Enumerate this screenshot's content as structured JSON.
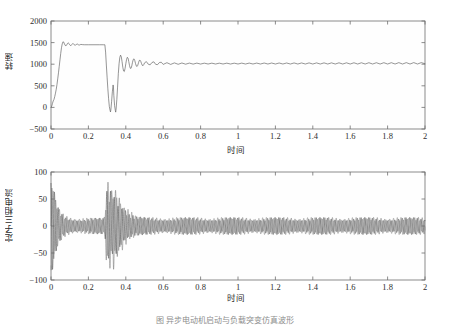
{
  "figure": {
    "caption": "图 异步电动机启动与负载突变仿真波形"
  },
  "chart_data": [
    {
      "id": "speed",
      "type": "line",
      "title": "",
      "xlabel": "时间",
      "ylabel": "转速",
      "xlim": [
        0,
        2
      ],
      "ylim": [
        -500,
        2000
      ],
      "xticks": [
        0,
        0.2,
        0.4,
        0.6,
        0.8,
        1,
        1.2,
        1.4,
        1.6,
        1.8,
        2
      ],
      "xticklabels": [
        "0",
        "0.2",
        "0.4",
        "0.6",
        "0.8",
        "1",
        "1.2",
        "1.4",
        "1.6",
        "1.8",
        "2"
      ],
      "yticks": [
        -500,
        0,
        500,
        1000,
        1500,
        2000
      ],
      "yticklabels": [
        "-500",
        "0",
        "500",
        "1000",
        "1500",
        "2000"
      ],
      "grid": false,
      "legend": null,
      "series": [
        {
          "name": "转速",
          "color": "#5d5d5d",
          "points": [
            [
              0.0,
              0
            ],
            [
              0.004,
              30
            ],
            [
              0.008,
              95
            ],
            [
              0.012,
              150
            ],
            [
              0.016,
              185
            ],
            [
              0.02,
              250
            ],
            [
              0.024,
              330
            ],
            [
              0.028,
              420
            ],
            [
              0.032,
              530
            ],
            [
              0.036,
              660
            ],
            [
              0.04,
              800
            ],
            [
              0.044,
              950
            ],
            [
              0.048,
              1100
            ],
            [
              0.052,
              1250
            ],
            [
              0.056,
              1380
            ],
            [
              0.06,
              1470
            ],
            [
              0.064,
              1520
            ],
            [
              0.068,
              1510
            ],
            [
              0.072,
              1470
            ],
            [
              0.076,
              1435
            ],
            [
              0.08,
              1425
            ],
            [
              0.084,
              1445
            ],
            [
              0.088,
              1480
            ],
            [
              0.092,
              1495
            ],
            [
              0.096,
              1480
            ],
            [
              0.1,
              1450
            ],
            [
              0.104,
              1432
            ],
            [
              0.108,
              1435
            ],
            [
              0.112,
              1458
            ],
            [
              0.116,
              1478
            ],
            [
              0.12,
              1472
            ],
            [
              0.124,
              1452
            ],
            [
              0.128,
              1438
            ],
            [
              0.132,
              1442
            ],
            [
              0.136,
              1460
            ],
            [
              0.14,
              1468
            ],
            [
              0.144,
              1458
            ],
            [
              0.148,
              1446
            ],
            [
              0.152,
              1444
            ],
            [
              0.156,
              1452
            ],
            [
              0.16,
              1458
            ],
            [
              0.17,
              1452
            ],
            [
              0.18,
              1450
            ],
            [
              0.2,
              1450
            ],
            [
              0.23,
              1450
            ],
            [
              0.26,
              1450
            ],
            [
              0.28,
              1450
            ],
            [
              0.288,
              1450
            ],
            [
              0.292,
              1280
            ],
            [
              0.296,
              980
            ],
            [
              0.3,
              700
            ],
            [
              0.304,
              430
            ],
            [
              0.308,
              200
            ],
            [
              0.312,
              20
            ],
            [
              0.316,
              -70
            ],
            [
              0.318,
              -105
            ],
            [
              0.32,
              -60
            ],
            [
              0.324,
              130
            ],
            [
              0.328,
              360
            ],
            [
              0.332,
              520
            ],
            [
              0.334,
              470
            ],
            [
              0.336,
              280
            ],
            [
              0.34,
              40
            ],
            [
              0.344,
              -70
            ],
            [
              0.346,
              -110
            ],
            [
              0.348,
              -40
            ],
            [
              0.352,
              180
            ],
            [
              0.356,
              470
            ],
            [
              0.36,
              780
            ],
            [
              0.364,
              1010
            ],
            [
              0.368,
              1160
            ],
            [
              0.372,
              1210
            ],
            [
              0.376,
              1170
            ],
            [
              0.38,
              1060
            ],
            [
              0.384,
              930
            ],
            [
              0.388,
              845
            ],
            [
              0.392,
              830
            ],
            [
              0.396,
              900
            ],
            [
              0.4,
              1010
            ],
            [
              0.404,
              1110
            ],
            [
              0.408,
              1160
            ],
            [
              0.412,
              1140
            ],
            [
              0.416,
              1060
            ],
            [
              0.42,
              965
            ],
            [
              0.424,
              905
            ],
            [
              0.428,
              905
            ],
            [
              0.432,
              960
            ],
            [
              0.436,
              1045
            ],
            [
              0.44,
              1110
            ],
            [
              0.444,
              1125
            ],
            [
              0.448,
              1085
            ],
            [
              0.452,
              1015
            ],
            [
              0.456,
              960
            ],
            [
              0.46,
              945
            ],
            [
              0.464,
              975
            ],
            [
              0.468,
              1035
            ],
            [
              0.472,
              1085
            ],
            [
              0.476,
              1095
            ],
            [
              0.48,
              1065
            ],
            [
              0.484,
              1015
            ],
            [
              0.488,
              975
            ],
            [
              0.492,
              965
            ],
            [
              0.496,
              990
            ],
            [
              0.5,
              1030
            ],
            [
              0.51,
              1060
            ],
            [
              0.52,
              1000
            ],
            [
              0.53,
              985
            ],
            [
              0.54,
              1040
            ],
            [
              0.55,
              1055
            ],
            [
              0.56,
              995
            ],
            [
              0.57,
              990
            ],
            [
              0.58,
              1040
            ],
            [
              0.59,
              1045
            ],
            [
              0.6,
              995
            ],
            [
              0.62,
              1035
            ],
            [
              0.64,
              995
            ],
            [
              0.66,
              1030
            ],
            [
              0.68,
              998
            ],
            [
              0.7,
              1028
            ],
            [
              0.72,
              1000
            ],
            [
              0.74,
              1026
            ],
            [
              0.76,
              1002
            ],
            [
              0.78,
              1025
            ],
            [
              0.8,
              1003
            ],
            [
              0.82,
              1024
            ],
            [
              0.84,
              1004
            ],
            [
              0.86,
              1024
            ],
            [
              0.88,
              1004
            ],
            [
              0.9,
              1024
            ],
            [
              0.92,
              1004
            ],
            [
              0.94,
              1024
            ],
            [
              0.96,
              1004
            ],
            [
              0.98,
              1024
            ],
            [
              1.0,
              1004
            ],
            [
              1.02,
              1025
            ],
            [
              1.04,
              1004
            ],
            [
              1.06,
              1026
            ],
            [
              1.08,
              1004
            ],
            [
              1.1,
              1026
            ],
            [
              1.12,
              1004
            ],
            [
              1.14,
              1027
            ],
            [
              1.16,
              1004
            ],
            [
              1.18,
              1027
            ],
            [
              1.2,
              1004
            ],
            [
              1.22,
              1028
            ],
            [
              1.24,
              1004
            ],
            [
              1.26,
              1028
            ],
            [
              1.28,
              1004
            ],
            [
              1.3,
              1029
            ],
            [
              1.32,
              1004
            ],
            [
              1.34,
              1029
            ],
            [
              1.36,
              1004
            ],
            [
              1.38,
              1030
            ],
            [
              1.4,
              1004
            ],
            [
              1.42,
              1030
            ],
            [
              1.44,
              1004
            ],
            [
              1.46,
              1031
            ],
            [
              1.48,
              1004
            ],
            [
              1.5,
              1031
            ],
            [
              1.52,
              1004
            ],
            [
              1.54,
              1032
            ],
            [
              1.56,
              1004
            ],
            [
              1.58,
              1032
            ],
            [
              1.6,
              1004
            ],
            [
              1.62,
              1033
            ],
            [
              1.64,
              1004
            ],
            [
              1.66,
              1033
            ],
            [
              1.68,
              1004
            ],
            [
              1.7,
              1034
            ],
            [
              1.72,
              1004
            ],
            [
              1.74,
              1034
            ],
            [
              1.76,
              1004
            ],
            [
              1.78,
              1035
            ],
            [
              1.8,
              1004
            ],
            [
              1.82,
              1035
            ],
            [
              1.84,
              1004
            ],
            [
              1.86,
              1036
            ],
            [
              1.88,
              1004
            ],
            [
              1.9,
              1036
            ],
            [
              1.92,
              1004
            ],
            [
              1.94,
              1037
            ],
            [
              1.96,
              1004
            ],
            [
              1.98,
              1037
            ],
            [
              2.0,
              1010
            ]
          ]
        }
      ]
    },
    {
      "id": "stator-current",
      "type": "line",
      "title": "",
      "xlabel": "时间",
      "ylabel": "定子三相电流",
      "xlim": [
        0,
        2
      ],
      "ylim": [
        -100,
        100
      ],
      "xticks": [
        0,
        0.2,
        0.4,
        0.6,
        0.8,
        1,
        1.2,
        1.4,
        1.6,
        1.8,
        2
      ],
      "xticklabels": [
        "0",
        "0.2",
        "0.4",
        "0.6",
        "0.8",
        "1",
        "1.2",
        "1.4",
        "1.6",
        "1.8",
        "2"
      ],
      "yticks": [
        -100,
        -50,
        0,
        50,
        100
      ],
      "yticklabels": [
        "-100",
        "-50",
        "0",
        "50",
        "100"
      ],
      "grid": false,
      "legend": null,
      "description": "三相定子电流：启动瞬间冲击约 ±90 A，快速衰减至约 ±15 A 稳态带；t≈0.29 s 负载突变再次冲击至约 ±90 A，t≈0.42 s 后恢复 ±15 A 稳态调制带。",
      "envelope": {
        "carrier_hz": 50,
        "phases": 3,
        "nodes": [
          [
            0.0,
            92
          ],
          [
            0.01,
            78
          ],
          [
            0.02,
            60
          ],
          [
            0.03,
            44
          ],
          [
            0.04,
            34
          ],
          [
            0.055,
            26
          ],
          [
            0.07,
            21
          ],
          [
            0.09,
            18
          ],
          [
            0.12,
            16
          ],
          [
            0.16,
            15
          ],
          [
            0.2,
            15
          ],
          [
            0.24,
            15
          ],
          [
            0.28,
            15
          ],
          [
            0.288,
            18
          ],
          [
            0.295,
            62
          ],
          [
            0.302,
            88
          ],
          [
            0.31,
            70
          ],
          [
            0.318,
            86
          ],
          [
            0.326,
            66
          ],
          [
            0.334,
            90
          ],
          [
            0.342,
            72
          ],
          [
            0.35,
            84
          ],
          [
            0.358,
            60
          ],
          [
            0.366,
            70
          ],
          [
            0.374,
            48
          ],
          [
            0.382,
            56
          ],
          [
            0.39,
            38
          ],
          [
            0.398,
            44
          ],
          [
            0.406,
            30
          ],
          [
            0.414,
            34
          ],
          [
            0.422,
            24
          ],
          [
            0.432,
            26
          ],
          [
            0.445,
            20
          ],
          [
            0.46,
            18
          ],
          [
            0.48,
            17
          ],
          [
            0.51,
            16
          ],
          [
            0.56,
            16
          ],
          [
            0.64,
            16
          ],
          [
            0.76,
            16
          ],
          [
            0.9,
            16
          ],
          [
            1.1,
            16
          ],
          [
            1.3,
            16
          ],
          [
            1.5,
            16
          ],
          [
            1.7,
            16
          ],
          [
            1.9,
            16
          ],
          [
            2.0,
            16
          ]
        ]
      }
    }
  ]
}
